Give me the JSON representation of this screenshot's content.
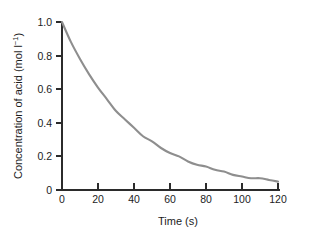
{
  "chart_data": {
    "type": "line",
    "title": "",
    "subtitle": "",
    "xlabel": "Time (s)",
    "ylabel": "Concentration of acid (mol l⁻¹)",
    "ylabel_main": "Concentration of acid (mol l",
    "ylabel_sup": "−1",
    "ylabel_tail": ")",
    "xlim": [
      0,
      126
    ],
    "ylim": [
      0,
      1.05
    ],
    "grid": false,
    "legend": false,
    "legend_position": "none",
    "xticks": [
      0,
      20,
      40,
      60,
      80,
      100,
      120
    ],
    "xtick_labels": [
      "0",
      "20",
      "40",
      "60",
      "80",
      "100",
      "120"
    ],
    "yticks": [
      0,
      0.2,
      0.4,
      0.6,
      0.8,
      1.0
    ],
    "ytick_labels": [
      "0",
      "0.2",
      "0.4",
      "0.6",
      "0.8",
      "1.0"
    ],
    "curve_color": "#8e8e8e",
    "axis_color": "#2b2b2b",
    "background_color": "#ffffff",
    "series": [
      {
        "name": "Concentration of acid",
        "x": [
          0,
          5,
          10,
          15,
          20,
          25,
          30,
          35,
          40,
          45,
          50,
          55,
          60,
          65,
          70,
          75,
          80,
          85,
          90,
          95,
          100,
          105,
          110,
          115,
          120
        ],
        "values": [
          1.0,
          0.88,
          0.78,
          0.69,
          0.61,
          0.54,
          0.47,
          0.42,
          0.37,
          0.32,
          0.29,
          0.25,
          0.22,
          0.2,
          0.17,
          0.15,
          0.14,
          0.12,
          0.11,
          0.09,
          0.08,
          0.07,
          0.07,
          0.06,
          0.05
        ]
      }
    ],
    "annotations": []
  },
  "figure": {
    "caption": ""
  }
}
